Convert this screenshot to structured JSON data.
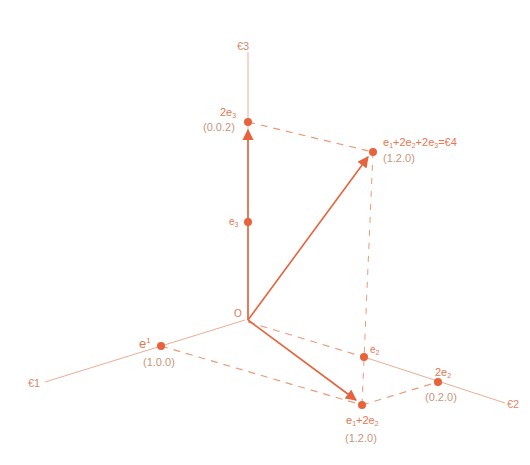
{
  "colors": {
    "vector": "#e8623c",
    "axis": "#ecae94",
    "dashed": "#eb9a78",
    "label": "#e8764f",
    "coord_label": "#c9957e"
  },
  "origin": {
    "label": "O",
    "x": 245,
    "y": 320
  },
  "axes": [
    {
      "id": "epsilon1",
      "label": "€1",
      "end": [
        45,
        382
      ]
    },
    {
      "id": "epsilon2",
      "label": "€2",
      "end": [
        505,
        403
      ]
    },
    {
      "id": "epsilon3",
      "label": "€3",
      "end": [
        248,
        52
      ]
    }
  ],
  "points": {
    "e1": {
      "label": "e1",
      "coord": "(1.0.0)",
      "x": 161,
      "y": 346
    },
    "e2": {
      "label": "e2",
      "coord": "",
      "x": 364,
      "y": 357
    },
    "two_e2": {
      "label": "2e2",
      "coord": "(0.2.0)",
      "x": 438,
      "y": 382
    },
    "e3": {
      "label": "e3",
      "coord": "",
      "x": 248,
      "y": 222
    },
    "two_e3": {
      "label": "2e3",
      "coord": "(0.0.2)",
      "x": 248,
      "y": 122
    },
    "e1_plus_2e2": {
      "label": "e1+2e2",
      "coord": "(1.2.0)",
      "x": 362,
      "y": 405
    },
    "e4": {
      "label": "e1+2e2+2e3=€4",
      "coord": "(1.2.0)",
      "x": 373,
      "y": 152
    }
  },
  "vectors": [
    {
      "from": "origin",
      "to": "two_e3"
    },
    {
      "from": "origin",
      "to": "e4"
    },
    {
      "from": "origin",
      "to": "e1_plus_2e2"
    }
  ],
  "dashed_lines": [
    [
      "two_e3",
      "e4"
    ],
    [
      "e4",
      "e1_plus_2e2"
    ],
    [
      "origin",
      "e2"
    ],
    [
      "e1",
      "e1_plus_2e2"
    ],
    [
      "e1_plus_2e2",
      "two_e2"
    ]
  ],
  "text": {
    "origin": "O",
    "axis1": "€1",
    "axis2": "€2",
    "axis3": "€3",
    "e1_main": "e",
    "e1_sup": "1",
    "e1_coord": "(1.0.0)",
    "e2_main": "e",
    "e2_sub": "2",
    "two_e2_main": "2e",
    "two_e2_sub": "2",
    "two_e2_coord": "(0.2.0)",
    "e3_main": "e",
    "e3_sub": "3",
    "two_e3_main": "2e",
    "two_e3_sub": "3",
    "two_e3_coord": "(0.0.2)",
    "sum12_a": "e",
    "sum12_a_sub": "1",
    "sum12_b": "+2e",
    "sum12_b_sub": "2",
    "sum12_coord": "(1.2.0)",
    "e4_a": "e",
    "e4_a_sub": "1",
    "e4_b": "+2e",
    "e4_b_sub": "2",
    "e4_c": "+2e",
    "e4_c_sub": "3",
    "e4_d": "=€4",
    "e4_coord": "(1.2.0)"
  }
}
